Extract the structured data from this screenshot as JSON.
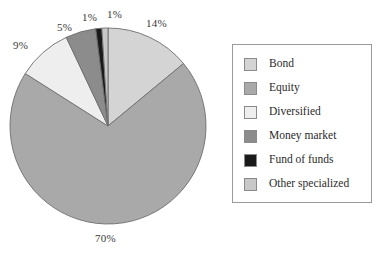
{
  "chart_data": {
    "type": "pie",
    "title": "",
    "subtitle": "",
    "xlabel": "",
    "ylabel": "",
    "legend_position": "right",
    "grid": false,
    "start_angle_deg": 0,
    "direction": "clockwise",
    "categories": [
      "Bond",
      "Equity",
      "Diversified",
      "Money market",
      "Fund of funds",
      "Other specialized"
    ],
    "values": [
      14,
      70,
      9,
      5,
      1,
      1
    ],
    "value_unit": "%",
    "data_labels": [
      "14%",
      "70%",
      "9%",
      "5%",
      "1%",
      "1%"
    ],
    "colors": [
      "#d4d4d4",
      "#a9a9a9",
      "#eeeeee",
      "#8c8c8c",
      "#1a1a1a",
      "#c8c8c8"
    ],
    "slices": [
      {
        "label": "Bond",
        "value": 14,
        "display": "14%",
        "color": "#d4d4d4"
      },
      {
        "label": "Equity",
        "value": 70,
        "display": "70%",
        "color": "#a9a9a9"
      },
      {
        "label": "Diversified",
        "value": 9,
        "display": "9%",
        "color": "#eeeeee"
      },
      {
        "label": "Money market",
        "value": 5,
        "display": "5%",
        "color": "#8c8c8c"
      },
      {
        "label": "Fund of funds",
        "value": 1,
        "display": "1%",
        "color": "#1a1a1a"
      },
      {
        "label": "Other specialized",
        "value": 1,
        "display": "1%",
        "color": "#c8c8c8"
      }
    ]
  },
  "legend": {
    "items": [
      {
        "label": "Bond",
        "color": "#d4d4d4"
      },
      {
        "label": "Equity",
        "color": "#a9a9a9"
      },
      {
        "label": "Diversified",
        "color": "#eeeeee"
      },
      {
        "label": "Money market",
        "color": "#8c8c8c"
      },
      {
        "label": "Fund of funds",
        "color": "#1a1a1a"
      },
      {
        "label": "Other specialized",
        "color": "#c8c8c8"
      }
    ]
  },
  "style": {
    "slice_outline": "#6e6e6e",
    "legend_border": "#9a9a9a",
    "background": "#ffffff",
    "label_color": "#3a3a3a"
  }
}
